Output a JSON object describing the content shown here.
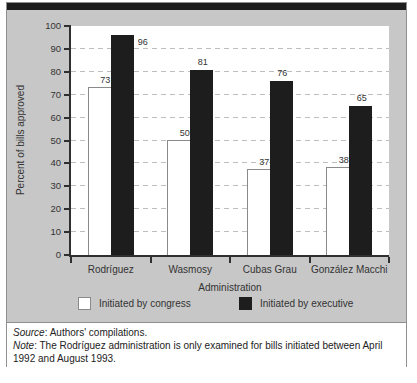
{
  "chart_data": {
    "type": "bar",
    "title": "",
    "categories": [
      "Rodríguez",
      "Wasmosy",
      "Cubas Grau",
      "González Macchi"
    ],
    "series": [
      {
        "name": "Initiated by congress",
        "color": "#ffffff",
        "values": [
          73,
          50,
          37,
          38
        ],
        "label_sides": [
          "top",
          "top",
          "top",
          "top"
        ]
      },
      {
        "name": "Initiated by executive",
        "color": "#1d1d1d",
        "values": [
          96,
          81,
          76,
          65
        ],
        "label_sides": [
          "right",
          "top",
          "top",
          "top"
        ]
      }
    ],
    "xlabel": "Administration",
    "ylabel": "Percent of bills approved",
    "ylim": [
      0,
      100
    ],
    "ytick_step": 10,
    "grid": "dashed-horizontal",
    "legend_position": "bottom",
    "value_labels": true
  },
  "footer": {
    "source_label": "Source",
    "source_text": ": Authors' compilations.",
    "note_label": "Note",
    "note_text": ": The Rodríguez administration is only examined for bills initiated between April 1992 and August 1993."
  },
  "colors": {
    "panel_background": "#c7c7c7",
    "top_bar": "#1d1d1d",
    "executive_bar": "#1d1d1d",
    "congress_bar_fill": "#ffffff",
    "congress_bar_border": "#8a8a8a",
    "axis": "#2f2f2f",
    "gridline": "#bdbdbd",
    "text": "#333333",
    "outer_border": "#8f8f8f",
    "footer_background": "#ffffff"
  }
}
